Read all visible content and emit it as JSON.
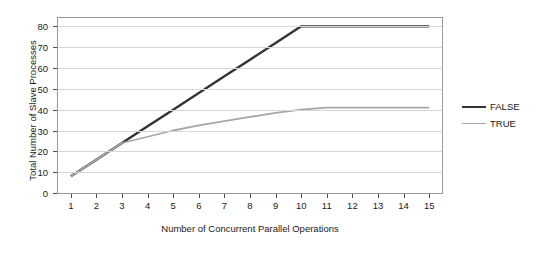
{
  "chart": {
    "title": "",
    "xlabel": "Number of Concurrent Parallel Operations",
    "ylabel": "Total Number of Slave Processes"
  },
  "legend": {
    "items": [
      {
        "label": "FALSE",
        "color": "#333333"
      },
      {
        "label": "TRUE",
        "color": "#a6a6a6"
      }
    ]
  },
  "chart_data": {
    "type": "line",
    "title": "",
    "xlabel": "Number of Concurrent Parallel Operations",
    "ylabel": "Total Number of Slave Processes",
    "x": [
      1,
      2,
      3,
      4,
      5,
      6,
      7,
      8,
      9,
      10,
      11,
      12,
      13,
      14,
      15
    ],
    "xticklabels": [
      "1",
      "2",
      "3",
      "4",
      "5",
      "6",
      "7",
      "8",
      "9",
      "10",
      "11",
      "12",
      "13",
      "14",
      "15"
    ],
    "yticklabels": [
      "0",
      "10",
      "20",
      "30",
      "40",
      "50",
      "60",
      "70",
      "80"
    ],
    "yticks": [
      0,
      10,
      20,
      30,
      40,
      50,
      60,
      70,
      80
    ],
    "xlim": [
      0.5,
      15.5
    ],
    "ylim": [
      0,
      84
    ],
    "grid": "horizontal",
    "legend_position": "right",
    "series": [
      {
        "name": "FALSE",
        "color": "#333333",
        "linewidth": 2.4,
        "values": [
          8,
          16,
          24,
          32,
          40,
          48,
          56,
          64,
          72,
          80,
          80,
          80,
          80,
          80,
          80
        ]
      },
      {
        "name": "TRUE",
        "color": "#a6a6a6",
        "linewidth": 1.8,
        "values": [
          8,
          16,
          24,
          27,
          30,
          32.5,
          34.5,
          36.5,
          38.5,
          40,
          41,
          41,
          41,
          41,
          41
        ]
      }
    ]
  }
}
